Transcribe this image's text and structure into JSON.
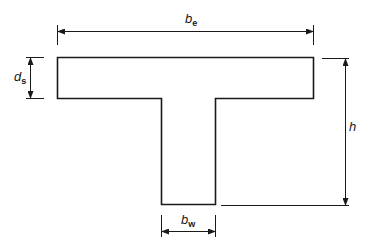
{
  "diagram": {
    "stroke_color": "#1a1a1a",
    "labels": {
      "flange_width": {
        "main": "b",
        "sub": "e"
      },
      "slab_depth": {
        "main": "d",
        "sub": "s"
      },
      "total_height": {
        "main": "h",
        "sub": ""
      },
      "web_width": {
        "main": "b",
        "sub": "w"
      }
    }
  }
}
